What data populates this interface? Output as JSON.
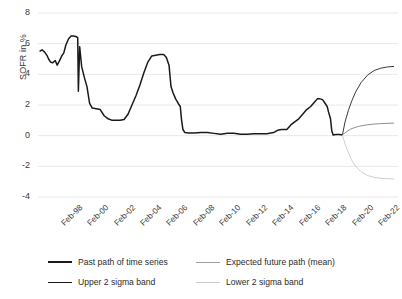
{
  "chart_data": {
    "type": "line",
    "title": "",
    "xlabel": "",
    "ylabel": "SOFR in %",
    "ylim": [
      -4,
      8
    ],
    "yticks": [
      8,
      6,
      4,
      2,
      0,
      -2,
      -4
    ],
    "xticks": [
      "Feb-98",
      "Feb-00",
      "Feb-02",
      "Feb-04",
      "Feb-06",
      "Feb-08",
      "Feb-10",
      "Feb-12",
      "Feb-14",
      "Feb-16",
      "Feb-18",
      "Feb-20",
      "Feb-22",
      "Feb-24"
    ],
    "grid": true,
    "legend_position": "bottom",
    "x_start": "Feb-98",
    "x_end": "Feb-25",
    "forecast_start": "Feb-21",
    "series": [
      {
        "name": "Past path of time series",
        "color": "#1a1a1a",
        "x": [
          1998.12,
          1998.3,
          1998.5,
          1998.7,
          1998.8,
          1998.95,
          1999.1,
          1999.3,
          1999.45,
          1999.6,
          1999.8,
          1999.95,
          2000.1,
          2000.3,
          2000.5,
          2000.7,
          2000.9,
          2001.0,
          2001.05,
          2001.15,
          2001.3,
          2001.5,
          2001.7,
          2001.9,
          2002.1,
          2002.4,
          2002.7,
          2003.0,
          2003.3,
          2003.6,
          2003.9,
          2004.2,
          2004.5,
          2004.8,
          2005.1,
          2005.4,
          2005.7,
          2006.0,
          2006.3,
          2006.6,
          2006.9,
          2007.2,
          2007.5,
          2007.7,
          2007.9,
          2008.05,
          2008.2,
          2008.4,
          2008.6,
          2008.75,
          2008.85,
          2008.95,
          2009.1,
          2009.4,
          2009.8,
          2010.3,
          2010.8,
          2011.3,
          2011.8,
          2012.3,
          2012.8,
          2013.3,
          2013.8,
          2014.3,
          2014.8,
          2015.3,
          2015.8,
          2016.1,
          2016.4,
          2016.8,
          2017.1,
          2017.4,
          2017.7,
          2018.0,
          2018.3,
          2018.6,
          2018.9,
          2019.1,
          2019.3,
          2019.5,
          2019.7,
          2019.85,
          2019.95,
          2020.1,
          2020.2,
          2020.3,
          2020.5,
          2020.8,
          2021.0
        ],
        "y": [
          5.5,
          5.6,
          5.45,
          5.2,
          5.0,
          4.8,
          4.75,
          4.9,
          4.6,
          4.85,
          5.2,
          5.4,
          5.9,
          6.3,
          6.5,
          6.5,
          6.45,
          6.4,
          2.9,
          5.8,
          4.5,
          3.8,
          3.2,
          2.1,
          1.8,
          1.75,
          1.7,
          1.3,
          1.1,
          1.0,
          1.0,
          1.0,
          1.05,
          1.4,
          2.0,
          2.6,
          3.3,
          4.1,
          4.8,
          5.2,
          5.25,
          5.3,
          5.3,
          5.1,
          4.6,
          3.2,
          2.8,
          2.4,
          2.1,
          1.9,
          1.0,
          0.4,
          0.2,
          0.18,
          0.18,
          0.2,
          0.2,
          0.15,
          0.1,
          0.15,
          0.15,
          0.1,
          0.1,
          0.12,
          0.12,
          0.13,
          0.2,
          0.35,
          0.4,
          0.4,
          0.7,
          0.9,
          1.1,
          1.4,
          1.7,
          1.9,
          2.2,
          2.4,
          2.4,
          2.35,
          2.1,
          1.9,
          1.55,
          1.1,
          0.3,
          0.05,
          0.08,
          0.08,
          0.05
        ]
      },
      {
        "name": "Expected future path (mean)",
        "color": "#8f8f8f",
        "x": [
          2021.0,
          2021.3,
          2021.6,
          2021.9,
          2022.3,
          2022.8,
          2023.3,
          2023.8,
          2024.3,
          2024.9
        ],
        "y": [
          0.05,
          0.25,
          0.42,
          0.52,
          0.62,
          0.7,
          0.75,
          0.78,
          0.8,
          0.82
        ]
      },
      {
        "name": "Upper 2 sigma band",
        "color": "#3b3b3b",
        "x": [
          2021.0,
          2021.2,
          2021.45,
          2021.7,
          2022.0,
          2022.4,
          2022.9,
          2023.4,
          2023.9,
          2024.4,
          2024.9
        ],
        "y": [
          0.05,
          0.9,
          1.65,
          2.25,
          2.85,
          3.45,
          3.95,
          4.25,
          4.4,
          4.48,
          4.52
        ]
      },
      {
        "name": "Lower 2 sigma band",
        "color": "#cfcfcf",
        "x": [
          2021.0,
          2021.2,
          2021.45,
          2021.7,
          2022.0,
          2022.4,
          2022.9,
          2023.4,
          2023.9,
          2024.4,
          2024.9
        ],
        "y": [
          0.05,
          -0.55,
          -1.1,
          -1.6,
          -2.0,
          -2.35,
          -2.6,
          -2.72,
          -2.78,
          -2.8,
          -2.82
        ]
      }
    ]
  },
  "axis": {
    "y_label": "SOFR in %",
    "y_ticks": [
      "8",
      "6",
      "4",
      "2",
      "0",
      "-2",
      "-4"
    ],
    "x_ticks": [
      "Feb-98",
      "Feb-00",
      "Feb-02",
      "Feb-04",
      "Feb-06",
      "Feb-08",
      "Feb-10",
      "Feb-12",
      "Feb-14",
      "Feb-16",
      "Feb-18",
      "Feb-20",
      "Feb-22",
      "Feb-24"
    ]
  },
  "legend": {
    "items": [
      {
        "label": "Past path of time series",
        "color": "#1a1a1a"
      },
      {
        "label": "Expected future path (mean)",
        "color": "#a0a0a0"
      },
      {
        "label": "Upper 2 sigma band",
        "color": "#1a1a1a"
      },
      {
        "label": "Lower 2 sigma band",
        "color": "#c9c9c9"
      }
    ]
  },
  "colors": {
    "grid": "#e8e8e8",
    "text": "#3a3a3a",
    "background": "#ffffff"
  }
}
